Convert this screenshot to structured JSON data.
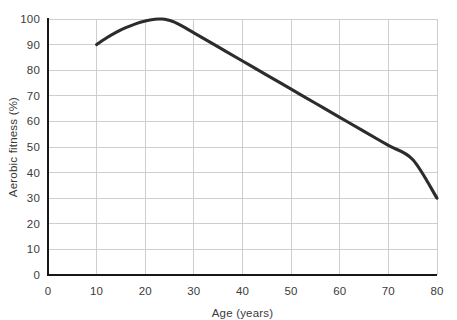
{
  "chart_data": {
    "type": "line",
    "title": "",
    "subtitle": "",
    "xlabel": "Age (years)",
    "ylabel": "Aerobic fitness (%)",
    "xlim": [
      0,
      80
    ],
    "ylim": [
      0,
      100
    ],
    "xticks": [
      0,
      10,
      20,
      30,
      40,
      50,
      60,
      70,
      80
    ],
    "yticks": [
      0,
      10,
      20,
      30,
      40,
      50,
      60,
      70,
      80,
      90,
      100
    ],
    "xtick_labels": [
      "0",
      "10",
      "20",
      "30",
      "40",
      "50",
      "60",
      "70",
      "80"
    ],
    "ytick_labels": [
      "0",
      "10",
      "20",
      "30",
      "40",
      "50",
      "60",
      "70",
      "80",
      "90",
      "100"
    ],
    "grid": true,
    "grid_color": "#c9c9c9",
    "legend": false,
    "legend_position": "none",
    "annotations": [],
    "series": [
      {
        "name": "Aerobic fitness",
        "color": "#2c2c2e",
        "line_width": 3.1,
        "x": [
          10,
          12,
          14,
          16,
          18,
          20,
          22,
          23,
          24,
          26,
          28,
          30,
          35,
          40,
          45,
          50,
          55,
          60,
          65,
          70,
          75,
          80
        ],
        "values": [
          90,
          92.6,
          94.8,
          96.6,
          98.1,
          99.2,
          99.9,
          100,
          99.9,
          98.8,
          96.8,
          94.6,
          89.1,
          83.6,
          78.1,
          72.6,
          67.1,
          61.6,
          56.1,
          50.6,
          45.1,
          30
        ]
      }
    ]
  },
  "axes": {
    "x_axis_name": "Age (years)",
    "y_axis_name": "Aerobic fitness (%)"
  },
  "geometry": {
    "plot_left": 48,
    "plot_right": 437,
    "plot_top": 19,
    "plot_bottom": 275
  }
}
